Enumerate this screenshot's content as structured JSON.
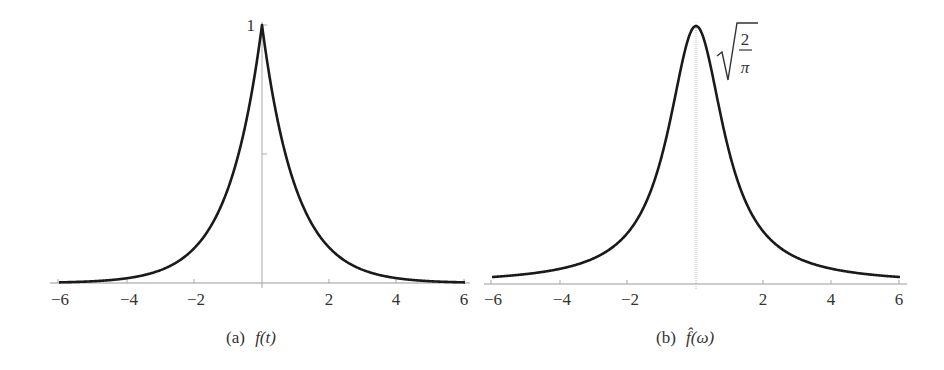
{
  "chart_data": [
    {
      "type": "line",
      "title": "",
      "caption": {
        "prefix": "(a)",
        "func": "f(t)"
      },
      "function": "f(t) = e^{-|t|}",
      "xlabel": "t",
      "ylabel": "",
      "xlim": [
        -6,
        6
      ],
      "ylim": [
        0,
        1
      ],
      "xticks": [
        "−6",
        "−4",
        "−2",
        "2",
        "4",
        "6"
      ],
      "xtick_values": [
        -6,
        -4,
        -2,
        2,
        4,
        6
      ],
      "yticks": [
        {
          "value": 0.5,
          "label": ""
        },
        {
          "value": 1,
          "label": "1"
        }
      ],
      "grid": false,
      "series": [
        {
          "name": "f(t)",
          "x": [
            -6,
            -5,
            -4,
            -3,
            -2,
            -1.5,
            -1,
            -0.5,
            0,
            0.5,
            1,
            1.5,
            2,
            3,
            4,
            5,
            6
          ],
          "values": [
            0.0025,
            0.0067,
            0.0183,
            0.0498,
            0.1353,
            0.2231,
            0.3679,
            0.6065,
            1,
            0.6065,
            0.3679,
            0.2231,
            0.1353,
            0.0498,
            0.0183,
            0.0067,
            0.0025
          ]
        }
      ]
    },
    {
      "type": "line",
      "title": "",
      "caption": {
        "prefix": "(b)",
        "func": "f̂(ω)"
      },
      "function": "f̂(ω) = √(2/π) / (1 + ω²)",
      "xlabel": "ω",
      "ylabel": "",
      "xlim": [
        -6,
        6
      ],
      "ylim": [
        0,
        0.798
      ],
      "xticks": [
        "−6",
        "−4",
        "−2",
        "2",
        "4",
        "6"
      ],
      "xtick_values": [
        -6,
        -4,
        -2,
        2,
        4,
        6
      ],
      "yticks": [
        {
          "value": 0.798,
          "label": "√(2/π)"
        }
      ],
      "peak_label": {
        "num": "2",
        "den": "π"
      },
      "grid": false,
      "series": [
        {
          "name": "f̂(ω)",
          "x": [
            -6,
            -5,
            -4,
            -3,
            -2,
            -1.5,
            -1,
            -0.5,
            0,
            0.5,
            1,
            1.5,
            2,
            3,
            4,
            5,
            6
          ],
          "values": [
            0.0216,
            0.0307,
            0.0469,
            0.0798,
            0.1596,
            0.2455,
            0.3989,
            0.6383,
            0.7979,
            0.6383,
            0.3989,
            0.2455,
            0.1596,
            0.0798,
            0.0469,
            0.0307,
            0.0216
          ]
        }
      ]
    }
  ]
}
